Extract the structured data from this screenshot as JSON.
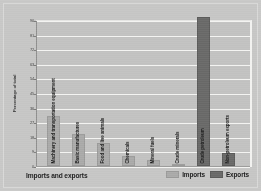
{
  "figure": {
    "background_color": "#c6c6c5",
    "plot_background_color": "#c2c2c1",
    "gridline_color": "#f4f4f2"
  },
  "axis": {
    "ylabel": "Percentage of total",
    "xlabel": "Imports and exports"
  },
  "legend": {
    "position": "bottom-right",
    "items": [
      {
        "label": "Imports",
        "color": "#aaaaa9"
      },
      {
        "label": "Exports",
        "color": "#6a6a69"
      }
    ]
  },
  "chart_data": {
    "type": "bar",
    "title": "",
    "subtitle": "",
    "xlabel": "Imports and exports",
    "ylabel": "Percentage of total",
    "ylim": [
      0,
      90
    ],
    "yticks": [
      0,
      9,
      18,
      27,
      36,
      45,
      54,
      63,
      72,
      81,
      90
    ],
    "ytick_labels": [
      "0",
      "9",
      "18",
      "27",
      "36",
      "45",
      "54",
      "63",
      "72",
      "81",
      "90"
    ],
    "grid": true,
    "legend_position": "bottom-right",
    "categories": [
      "Machinery and transportation equipment",
      "Basic manufactures",
      "Food and live animals",
      "Chemicals",
      "Mineral fuels",
      "Crude minerals",
      "Crude petroleum",
      "Non-petroleum exports"
    ],
    "series": [
      {
        "name": "Imports",
        "color": "#aaaaa9",
        "values": [
          31,
          20,
          14,
          6,
          4,
          1.5,
          null,
          null
        ]
      },
      {
        "name": "Exports",
        "color": "#6a6a69",
        "values": [
          null,
          null,
          null,
          null,
          null,
          null,
          92,
          8
        ]
      }
    ],
    "bars": [
      {
        "category": "Machinery and transportation equipment",
        "series": "Imports",
        "value": 31
      },
      {
        "category": "Basic manufactures",
        "series": "Imports",
        "value": 20
      },
      {
        "category": "Food and live animals",
        "series": "Imports",
        "value": 14
      },
      {
        "category": "Chemicals",
        "series": "Imports",
        "value": 6
      },
      {
        "category": "Mineral fuels",
        "series": "Imports",
        "value": 4
      },
      {
        "category": "Crude minerals",
        "series": "Imports",
        "value": 1.5
      },
      {
        "category": "Crude petroleum",
        "series": "Exports",
        "value": 92
      },
      {
        "category": "Non-petroleum exports",
        "series": "Exports",
        "value": 8
      }
    ]
  }
}
